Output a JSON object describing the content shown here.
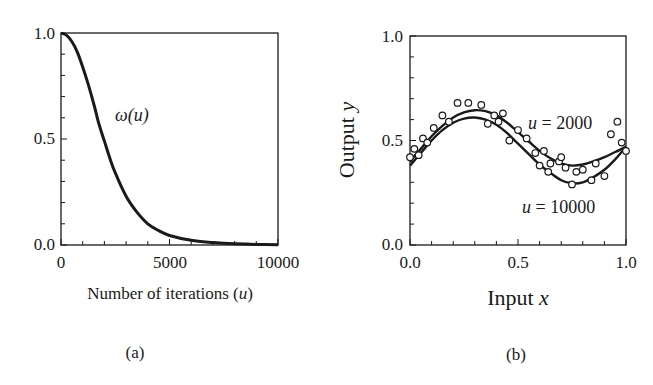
{
  "figure": {
    "panel_a_label": "(a)",
    "panel_b_label": "(b)"
  },
  "chart_data": [
    {
      "type": "line",
      "panel": "(a)",
      "title": "",
      "xlabel": "Number of iterations (u)",
      "xlabel_text": "Number of iterations (",
      "xlabel_var": "u",
      "xlabel_close": ")",
      "ylabel": "",
      "xlim": [
        0,
        10000
      ],
      "ylim": [
        0.0,
        1.0
      ],
      "x_ticks": [
        "0",
        "5000",
        "10000"
      ],
      "y_ticks": [
        "0.0",
        "0.5",
        "1.0"
      ],
      "grid": false,
      "annotation": "ω(u)",
      "series": [
        {
          "name": "ω(u)",
          "x": [
            0,
            250,
            500,
            750,
            1000,
            1250,
            1500,
            1750,
            2000,
            2250,
            2500,
            3000,
            3500,
            4000,
            4500,
            5000,
            6000,
            7000,
            8000,
            9000,
            10000
          ],
          "values": [
            1.0,
            0.99,
            0.96,
            0.91,
            0.84,
            0.76,
            0.67,
            0.57,
            0.49,
            0.41,
            0.34,
            0.23,
            0.155,
            0.1,
            0.068,
            0.045,
            0.022,
            0.012,
            0.006,
            0.003,
            0.001
          ]
        }
      ]
    },
    {
      "type": "line",
      "panel": "(b)",
      "title": "",
      "xlabel": "Input x",
      "xlabel_text": "Input ",
      "xlabel_var": "x",
      "ylabel": "Output y",
      "ylabel_text": "Output ",
      "ylabel_var": "y",
      "xlim": [
        0.0,
        1.0
      ],
      "ylim": [
        0.0,
        1.0
      ],
      "x_ticks": [
        "0.0",
        "0.5",
        "1.0"
      ],
      "y_ticks": [
        "0.0",
        "0.5",
        "1.0"
      ],
      "grid": false,
      "annotations": [
        {
          "text_var": "u",
          "text_rest": " = 2000",
          "text": "u = 2000"
        },
        {
          "text_var": "u",
          "text_rest": " = 10000",
          "text": "u = 10000"
        }
      ],
      "series": [
        {
          "name": "u = 2000",
          "style": "solid line",
          "x": [
            0.0,
            0.05,
            0.1,
            0.15,
            0.2,
            0.25,
            0.3,
            0.35,
            0.4,
            0.45,
            0.5,
            0.55,
            0.6,
            0.65,
            0.7,
            0.75,
            0.8,
            0.85,
            0.9,
            0.95,
            1.0
          ],
          "values": [
            0.4,
            0.46,
            0.52,
            0.57,
            0.61,
            0.635,
            0.645,
            0.64,
            0.62,
            0.585,
            0.54,
            0.495,
            0.45,
            0.415,
            0.39,
            0.38,
            0.385,
            0.4,
            0.42,
            0.445,
            0.47
          ]
        },
        {
          "name": "u = 10000",
          "style": "solid line",
          "x": [
            0.0,
            0.05,
            0.1,
            0.15,
            0.2,
            0.25,
            0.3,
            0.35,
            0.4,
            0.45,
            0.5,
            0.55,
            0.6,
            0.65,
            0.7,
            0.75,
            0.8,
            0.85,
            0.9,
            0.95,
            1.0
          ],
          "values": [
            0.38,
            0.44,
            0.5,
            0.55,
            0.585,
            0.605,
            0.61,
            0.6,
            0.575,
            0.535,
            0.485,
            0.435,
            0.385,
            0.345,
            0.31,
            0.295,
            0.3,
            0.325,
            0.36,
            0.41,
            0.47
          ]
        },
        {
          "name": "training samples",
          "style": "open circles",
          "x": [
            0.0,
            0.02,
            0.04,
            0.06,
            0.08,
            0.11,
            0.15,
            0.18,
            0.22,
            0.27,
            0.33,
            0.36,
            0.39,
            0.41,
            0.43,
            0.46,
            0.5,
            0.54,
            0.58,
            0.6,
            0.62,
            0.64,
            0.65,
            0.69,
            0.7,
            0.72,
            0.75,
            0.77,
            0.8,
            0.84,
            0.86,
            0.9,
            0.93,
            0.96,
            0.98,
            1.0
          ],
          "values": [
            0.42,
            0.46,
            0.43,
            0.51,
            0.49,
            0.56,
            0.62,
            0.59,
            0.68,
            0.68,
            0.67,
            0.58,
            0.62,
            0.59,
            0.63,
            0.5,
            0.55,
            0.51,
            0.44,
            0.38,
            0.45,
            0.35,
            0.39,
            0.4,
            0.42,
            0.37,
            0.29,
            0.35,
            0.36,
            0.31,
            0.39,
            0.33,
            0.53,
            0.59,
            0.49,
            0.45
          ]
        }
      ]
    }
  ]
}
